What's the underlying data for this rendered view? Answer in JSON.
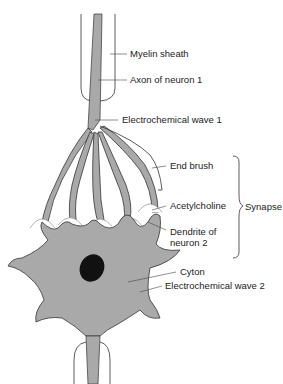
{
  "diagram": {
    "type": "neuron-synapse-illustration",
    "labels": {
      "myelin_sheath": "Myelin sheath",
      "axon": "Axon of neuron 1",
      "wave1": "Electrochemical wave 1",
      "end_brush": "End brush",
      "acetylcholine": "Acetylcholine",
      "dendrite_line1": "Dendrite of",
      "dendrite_line2": "neuron 2",
      "synapse": "Synapse",
      "cyton": "Cyton",
      "wave2": "Electrochemical wave 2"
    },
    "colors": {
      "cell_fill": "#a9a9a9",
      "outline": "#333333",
      "nucleus": "#111111",
      "background": "#ffffff"
    }
  }
}
